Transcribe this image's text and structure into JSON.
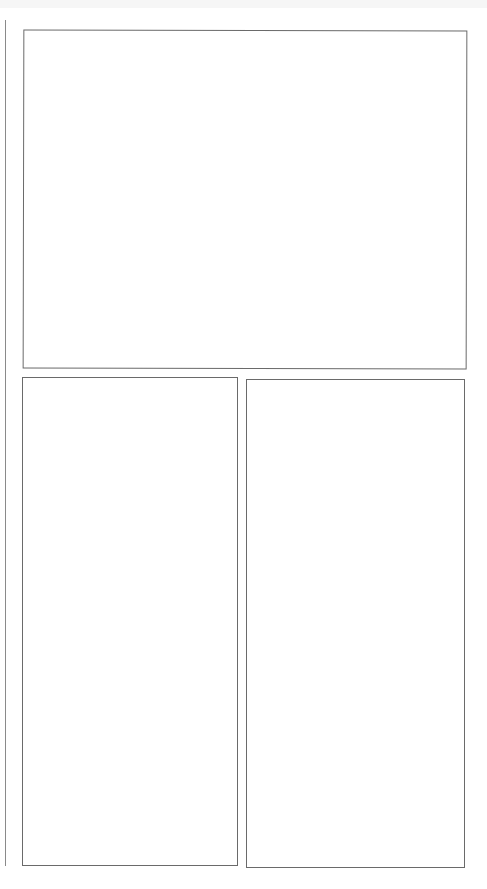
{
  "page": {
    "type": "comic-panel-template",
    "panels": [
      {
        "id": "top",
        "content": ""
      },
      {
        "id": "bottom-left",
        "content": ""
      },
      {
        "id": "bottom-right",
        "content": ""
      }
    ]
  }
}
